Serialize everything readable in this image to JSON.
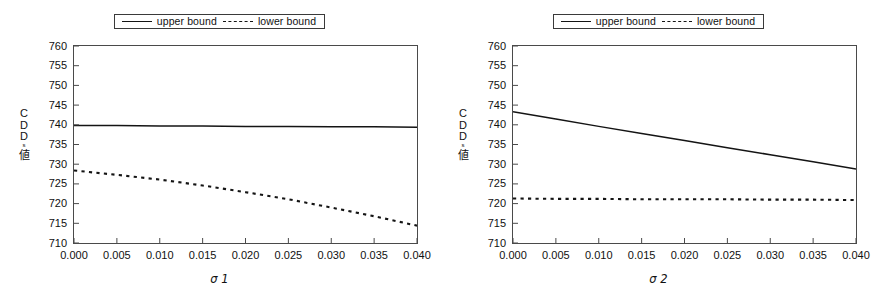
{
  "figure": {
    "background": "#ffffff",
    "line_color": "#141414",
    "axis_color": "#4a4a4a"
  },
  "panels": [
    {
      "id": "panel-sigma1",
      "legend": {
        "upper_label": "upper bound",
        "lower_label": "lower bound"
      },
      "ylabel_chars": [
        "C",
        "D",
        "D",
        "s",
        "値"
      ],
      "xlabel": "σ 1",
      "chart_data": {
        "type": "line",
        "title": "",
        "xlabel": "σ 1",
        "ylabel": "CDDs値",
        "xlim": [
          0.0,
          0.04
        ],
        "ylim": [
          710,
          760
        ],
        "xticks": [
          0.0,
          0.005,
          0.01,
          0.015,
          0.02,
          0.025,
          0.03,
          0.035,
          0.04
        ],
        "xtick_labels": [
          "0.000",
          "0.005",
          "0.010",
          "0.015",
          "0.020",
          "0.025",
          "0.030",
          "0.035",
          "0.040"
        ],
        "yticks": [
          710,
          715,
          720,
          725,
          730,
          735,
          740,
          745,
          750,
          755,
          760
        ],
        "ytick_labels": [
          "710",
          "715",
          "720",
          "725",
          "730",
          "735",
          "740",
          "745",
          "750",
          "755",
          "760"
        ],
        "grid": false,
        "legend_position": "top-center",
        "x": [
          0.0,
          0.005,
          0.01,
          0.015,
          0.02,
          0.025,
          0.03,
          0.035,
          0.04
        ],
        "series": [
          {
            "name": "upper bound",
            "style": "solid",
            "values": [
              739.8,
              739.8,
              739.7,
              739.7,
              739.6,
              739.6,
              739.5,
              739.5,
              739.4
            ]
          },
          {
            "name": "lower bound",
            "style": "dotted",
            "values": [
              728.4,
              727.3,
              726.1,
              724.6,
              722.9,
              721.1,
              719.0,
              716.8,
              714.4
            ]
          }
        ]
      }
    },
    {
      "id": "panel-sigma2",
      "legend": {
        "upper_label": "upper bound",
        "lower_label": "lower bound"
      },
      "ylabel_chars": [
        "C",
        "D",
        "D",
        "s",
        "値"
      ],
      "xlabel": "σ 2",
      "chart_data": {
        "type": "line",
        "title": "",
        "xlabel": "σ 2",
        "ylabel": "CDDs値",
        "xlim": [
          0.0,
          0.04
        ],
        "ylim": [
          710,
          760
        ],
        "xticks": [
          0.0,
          0.005,
          0.01,
          0.015,
          0.02,
          0.025,
          0.03,
          0.035,
          0.04
        ],
        "xtick_labels": [
          "0.000",
          "0.005",
          "0.010",
          "0.015",
          "0.020",
          "0.025",
          "0.030",
          "0.035",
          "0.040"
        ],
        "yticks": [
          710,
          715,
          720,
          725,
          730,
          735,
          740,
          745,
          750,
          755,
          760
        ],
        "ytick_labels": [
          "710",
          "715",
          "720",
          "725",
          "730",
          "735",
          "740",
          "745",
          "750",
          "755",
          "760"
        ],
        "grid": false,
        "legend_position": "top-center",
        "x": [
          0.0,
          0.005,
          0.01,
          0.015,
          0.02,
          0.025,
          0.03,
          0.035,
          0.04
        ],
        "series": [
          {
            "name": "upper bound",
            "style": "solid",
            "values": [
              743.3,
              741.5,
              739.6,
              737.8,
              736.0,
              734.2,
              732.4,
              730.6,
              728.8
            ]
          },
          {
            "name": "lower bound",
            "style": "dotted",
            "values": [
              721.3,
              721.2,
              721.2,
              721.1,
              721.1,
              721.1,
              721.0,
              721.0,
              720.9
            ]
          }
        ]
      }
    }
  ]
}
